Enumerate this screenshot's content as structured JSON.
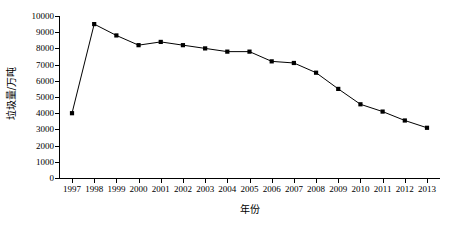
{
  "chart_data": {
    "type": "line",
    "title": "",
    "xlabel": "年份",
    "ylabel": "垃圾量/万吨",
    "categories": [
      "1997",
      "1998",
      "1999",
      "2000",
      "2001",
      "2002",
      "2003",
      "2004",
      "2005",
      "2006",
      "2007",
      "2008",
      "2009",
      "2010",
      "2011",
      "2012",
      "2013"
    ],
    "values": [
      4000,
      9500,
      8800,
      8200,
      8400,
      8200,
      8000,
      7800,
      7800,
      7200,
      7100,
      6500,
      5500,
      4550,
      4100,
      3550,
      3100
    ],
    "series": [
      {
        "name": "垃圾量",
        "values": [
          4000,
          9500,
          8800,
          8200,
          8400,
          8200,
          8000,
          7800,
          7800,
          7200,
          7100,
          6500,
          5500,
          4550,
          4100,
          3550,
          3100
        ]
      }
    ],
    "x": [
      "1997",
      "1998",
      "1999",
      "2000",
      "2001",
      "2002",
      "2003",
      "2004",
      "2005",
      "2006",
      "2007",
      "2008",
      "2009",
      "2010",
      "2011",
      "2012",
      "2013"
    ],
    "ylim": [
      0,
      10000
    ],
    "ytick_labels": [
      "0",
      "1000",
      "2000",
      "3000",
      "4000",
      "5000",
      "6000",
      "7000",
      "8000",
      "9000",
      "10000"
    ],
    "ytick_values": [
      0,
      1000,
      2000,
      3000,
      4000,
      5000,
      6000,
      7000,
      8000,
      9000,
      10000
    ],
    "xlim": [
      "1997",
      "2013"
    ],
    "grid": false,
    "legend": false,
    "legend_position": "none",
    "marker": "square",
    "line_color": "#000000",
    "marker_color": "#000000",
    "background_color": "#ffffff"
  }
}
